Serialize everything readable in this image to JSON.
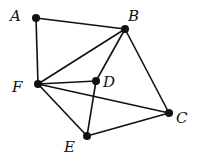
{
  "diagram": {
    "title": "",
    "nodes": [
      {
        "id": "A",
        "label": "A"
      },
      {
        "id": "B",
        "label": "B"
      },
      {
        "id": "C",
        "label": "C"
      },
      {
        "id": "D",
        "label": "D"
      },
      {
        "id": "E",
        "label": "E"
      },
      {
        "id": "F",
        "label": "F"
      }
    ],
    "edges": [
      [
        "A",
        "B"
      ],
      [
        "A",
        "F"
      ],
      [
        "B",
        "F"
      ],
      [
        "B",
        "D"
      ],
      [
        "B",
        "C"
      ],
      [
        "F",
        "D"
      ],
      [
        "F",
        "C"
      ],
      [
        "F",
        "E"
      ],
      [
        "D",
        "E"
      ],
      [
        "E",
        "C"
      ]
    ]
  }
}
